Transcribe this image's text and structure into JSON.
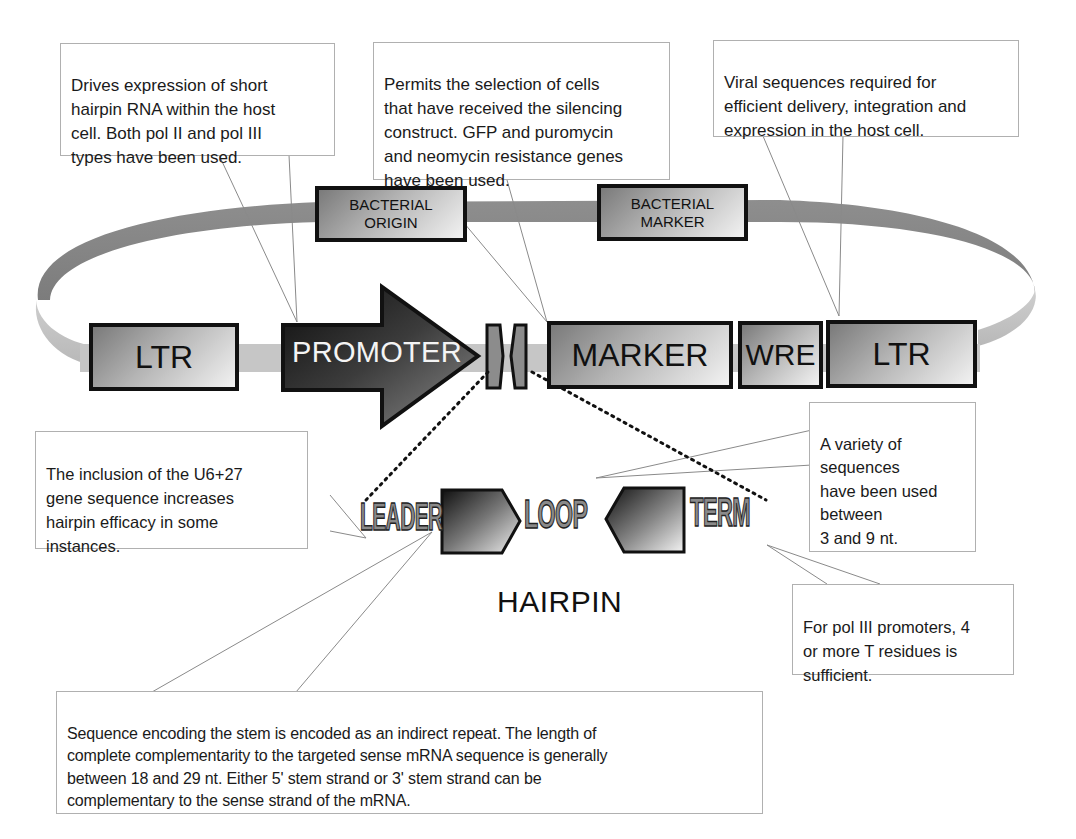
{
  "diagram": {
    "vector_elements": [
      {
        "id": "ltr_left",
        "label": "LTR"
      },
      {
        "id": "promoter",
        "label": "PROMOTER"
      },
      {
        "id": "marker",
        "label": "MARKER"
      },
      {
        "id": "wre",
        "label": "WRE"
      },
      {
        "id": "ltr_right",
        "label": "LTR"
      }
    ],
    "plasmid_backbone_elements": [
      {
        "id": "bacterial_origin",
        "label": "BACTERIAL\nORIGIN"
      },
      {
        "id": "bacterial_marker",
        "label": "BACTERIAL\nMARKER"
      }
    ],
    "hairpin": {
      "title": "HAIRPIN",
      "parts": [
        {
          "id": "leader",
          "label": "LEADER"
        },
        {
          "id": "stem_sense",
          "label": ""
        },
        {
          "id": "loop",
          "label": "LOOP"
        },
        {
          "id": "stem_antisense",
          "label": ""
        },
        {
          "id": "term",
          "label": "TERM"
        }
      ]
    },
    "callouts": {
      "promoter": "Drives expression of short\nhairpin RNA within the host\ncell. Both pol II and pol III\ntypes have been used.",
      "marker": "Permits the selection of cells\nthat have received the silencing\nconstruct. GFP and puromycin\nand neomycin resistance genes\nhave been used.",
      "viral": "Viral sequences required for\nefficient delivery, integration and\nexpression in the host cell.",
      "leader": "The inclusion of the U6+27\ngene sequence increases\nhairpin efficacy in some\ninstances.",
      "loop": "A variety of\nsequences\nhave been used\nbetween\n 3 and 9 nt.",
      "term": "For pol III promoters, 4\nor more T residues is\nsufficient.",
      "stem": "Sequence encoding the stem is encoded as an indirect repeat. The length of\ncomplete complementarity to the targeted sense mRNA sequence is generally\nbetween 18 and 29 nt. Either 5' stem strand or 3' stem strand can be\ncomplementary to the sense strand of the mRNA."
    },
    "colors": {
      "backbone_dark": "#8c8c8c",
      "backbone_light": "#c4c4c4",
      "promoter_dark": "#1a1a1a",
      "box_outline": "#111111",
      "callout_border": "#b0b0b0"
    }
  }
}
